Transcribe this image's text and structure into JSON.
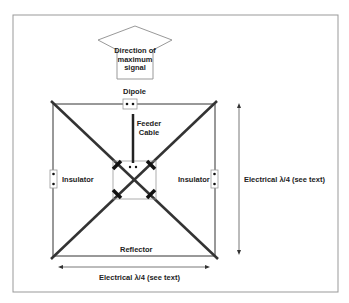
{
  "diagram": {
    "arrow_label": [
      "Direction of",
      "maximum",
      "signal"
    ],
    "dipole": "Dipole",
    "feeder": [
      "Feeder",
      "Cable"
    ],
    "insulator_left": "Insulator",
    "insulator_right": "Insulator",
    "reflector": "Reflector",
    "dim_vertical": "Electrical λ/4 (see text)",
    "dim_horizontal": "Electrical λ/4 (see text)"
  }
}
